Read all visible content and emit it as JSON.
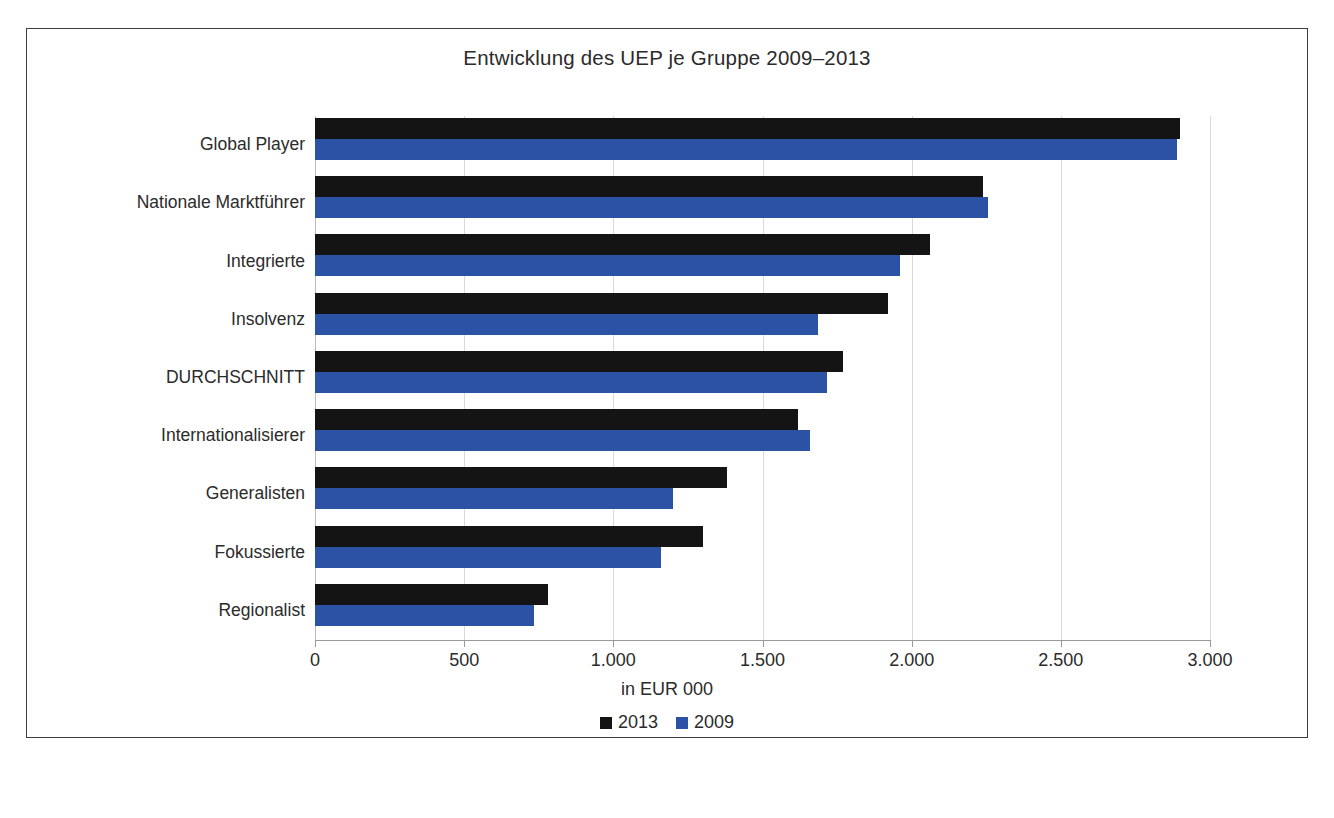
{
  "chart_data": {
    "type": "bar",
    "orientation": "horizontal",
    "title": "Entwicklung des UEP je Gruppe 2009–2013",
    "xlabel": "in EUR 000",
    "ylabel": "",
    "xlim": [
      0,
      3000
    ],
    "xticks": [
      0,
      500,
      1000,
      1500,
      2000,
      2500,
      3000
    ],
    "xticklabels": [
      "0",
      "500",
      "1.000",
      "1.500",
      "2.000",
      "2.500",
      "3.000"
    ],
    "grid": "vertical",
    "legend_position": "bottom",
    "categories": [
      "Global Player",
      "Nationale Marktführer",
      "Integrierte",
      "Insolvenz",
      "DURCHSCHNITT",
      "Internationalisierer",
      "Generalisten",
      "Fokussierte",
      "Regionalist"
    ],
    "series": [
      {
        "name": "2013",
        "color": "#141414",
        "values": [
          2900,
          2240,
          2060,
          1920,
          1770,
          1620,
          1380,
          1300,
          780
        ]
      },
      {
        "name": "2009",
        "color": "#2b52a5",
        "values": [
          2890,
          2255,
          1960,
          1685,
          1715,
          1660,
          1200,
          1160,
          735
        ]
      }
    ]
  },
  "figure": {
    "caption": ""
  }
}
